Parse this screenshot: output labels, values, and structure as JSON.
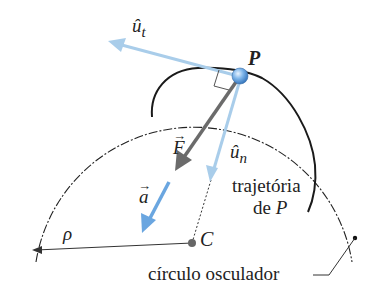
{
  "diagram": {
    "type": "physics-kinematics",
    "labels": {
      "unit_tangent": "û",
      "unit_tangent_sub": "t",
      "point": "P",
      "force": "F",
      "force_arrow": "→",
      "unit_normal": "û",
      "unit_normal_sub": "n",
      "acceleration": "a",
      "acceleration_arrow": "→",
      "radius": "ρ",
      "center": "C",
      "trajectory_line1": "trajetória",
      "trajectory_line2": "de ",
      "trajectory_point": "P",
      "osculating_circle": "círculo osculador"
    },
    "colors": {
      "light_blue": "#a9cdea",
      "blue": "#6aa6e0",
      "gray_arrow": "#6b6b6b",
      "curve": "#1a1a1a",
      "point_fill": "#5b9ee0",
      "center_fill": "#666666"
    }
  }
}
